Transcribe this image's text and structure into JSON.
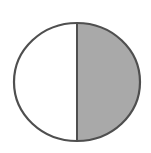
{
  "diagram": {
    "type": "fraction-circle",
    "parts_total": 2,
    "parts_shaded": 1,
    "shaded_side": "right",
    "colors": {
      "background": "#ffffff",
      "unshaded_fill": "#ffffff",
      "shaded_fill": "#a9a9a9",
      "stroke": "#4f4f4f"
    }
  }
}
